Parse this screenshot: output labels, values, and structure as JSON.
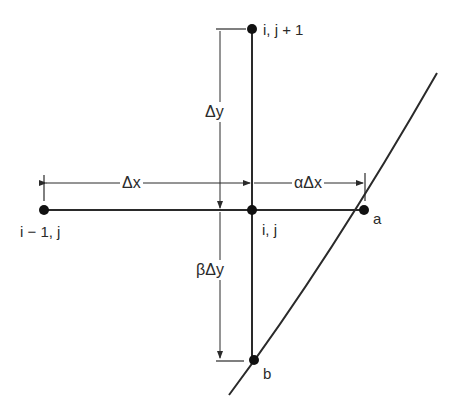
{
  "diagram": {
    "colors": {
      "line": "#2a2a2a",
      "node": "#111111",
      "background": "#ffffff"
    },
    "nodes": [
      {
        "id": "i-1,j",
        "label": "i − 1, j",
        "x": 44,
        "y": 210
      },
      {
        "id": "i,j",
        "label": "i, j",
        "x": 252,
        "y": 210
      },
      {
        "id": "i,j+1",
        "label": "i, j + 1",
        "x": 252,
        "y": 29
      },
      {
        "id": "a",
        "label": "a",
        "x": 364,
        "y": 210
      },
      {
        "id": "b",
        "label": "b",
        "x": 254,
        "y": 360
      }
    ],
    "dimensions": {
      "dx": "Δx",
      "adx": "αΔx",
      "dy": "Δy",
      "bdy": "βΔy"
    },
    "boundary_curve": "curved boundary passing through a and b"
  }
}
